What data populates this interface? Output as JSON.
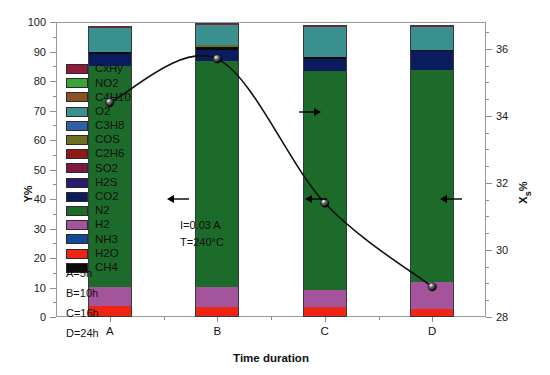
{
  "chart_data": {
    "type": "bar",
    "title": "",
    "xlabel": "Time duration",
    "ylabel": "Y%",
    "y2label": "Xs%",
    "categories": [
      "A",
      "B",
      "C",
      "D"
    ],
    "ylim": [
      0,
      100
    ],
    "yticks": [
      0,
      10,
      20,
      30,
      40,
      50,
      60,
      70,
      80,
      90,
      100
    ],
    "y2lim": [
      28,
      36.8
    ],
    "y2ticks": [
      28,
      30,
      32,
      34,
      36
    ],
    "grid": false,
    "legend_position": "inside-left",
    "stacked": true,
    "series": [
      {
        "name": "H2O",
        "color": "#ef2514",
        "values": [
          4.0,
          3.6,
          3.8,
          3.2
        ]
      },
      {
        "name": "H2",
        "color": "#a4549a",
        "values": [
          6.5,
          6.8,
          5.6,
          9.0
        ]
      },
      {
        "name": "N2",
        "color": "#1d6b2a",
        "values": [
          74.8,
          76.6,
          74.4,
          71.9
        ]
      },
      {
        "name": "CO2",
        "color": "#0b1c5e",
        "values": [
          4.1,
          4.0,
          4.1,
          6.6
        ]
      },
      {
        "name": "CH4",
        "color": "#0a0a0a",
        "values": [
          0.7,
          0.9,
          0.7,
          0.3
        ]
      },
      {
        "name": "COS",
        "color": "#6e6f23",
        "values": [
          0.0,
          0.6,
          0.0,
          0.0
        ]
      },
      {
        "name": "O2",
        "color": "#3a8f8f",
        "values": [
          8.2,
          6.8,
          9.9,
          7.8
        ]
      },
      {
        "name": "CxHy",
        "color": "#8e1b3b",
        "values": [
          0.2,
          0.5,
          0.4,
          0.1
        ]
      }
    ],
    "line_series": {
      "name": "Xs%",
      "color": "#111111",
      "marker": "circle-3d",
      "x": [
        "A",
        "B",
        "C",
        "D"
      ],
      "values": [
        34.4,
        35.7,
        31.4,
        28.9
      ]
    },
    "annotations": [
      {
        "text": "I=0.03 A",
        "x": 185,
        "y": 224
      },
      {
        "text": "T=240°C",
        "x": 185,
        "y": 240
      }
    ],
    "arrow_annotations": [
      {
        "direction": "left",
        "x": 178,
        "y": 199
      },
      {
        "direction": "left",
        "x": 316,
        "y": 199
      },
      {
        "direction": "left",
        "x": 451,
        "y": 199
      },
      {
        "direction": "right",
        "x": 310,
        "y": 112
      }
    ]
  },
  "legend": {
    "items": [
      {
        "label": "CxHy",
        "color": "#8e1b3b"
      },
      {
        "label": "NO2",
        "color": "#3aa33a"
      },
      {
        "label": "C4H10",
        "color": "#8a5220"
      },
      {
        "label": "O2",
        "color": "#3a8f8f"
      },
      {
        "label": "C3H8",
        "color": "#2f5fa8"
      },
      {
        "label": "COS",
        "color": "#6e6f23"
      },
      {
        "label": "C2H6",
        "color": "#8f1a14"
      },
      {
        "label": "SO2",
        "color": "#7d1840"
      },
      {
        "label": "H2S",
        "color": "#2a1a6e"
      },
      {
        "label": "CO2",
        "color": "#0b1c5e"
      },
      {
        "label": "N2",
        "color": "#1d6b2a"
      },
      {
        "label": "H2",
        "color": "#a4549a"
      },
      {
        "label": "NH3",
        "color": "#15479b"
      },
      {
        "label": "H2O",
        "color": "#ef2514"
      },
      {
        "label": "CH4",
        "color": "#0a0a0a"
      }
    ]
  },
  "notes": {
    "duration_key": [
      "A=5h",
      "B=10h",
      "C=16h",
      "D=24h"
    ],
    "conditions": [
      "I=0.03 A",
      "T=240°C"
    ]
  }
}
